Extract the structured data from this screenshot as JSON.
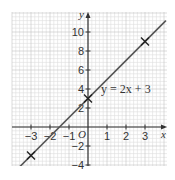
{
  "chart_data": {
    "type": "line",
    "title": "",
    "xlabel": "x",
    "ylabel": "y",
    "origin_label": "O",
    "xlim": [
      -4,
      4.2
    ],
    "ylim": [
      -4,
      12
    ],
    "grid": true,
    "x_ticks": [
      -3,
      -2,
      -1,
      1,
      2,
      3
    ],
    "x_tick_labels": [
      "−3",
      "−2",
      "−1",
      "1",
      "2",
      "3"
    ],
    "y_ticks": [
      -4,
      -2,
      2,
      4,
      6,
      8,
      10
    ],
    "y_tick_labels": [
      "−4",
      "−2",
      "2",
      "4",
      "6",
      "8",
      "10"
    ],
    "series": [
      {
        "name": "y = 2x + 3",
        "equation": "y = 2x + 3",
        "slope": 2,
        "intercept": 3,
        "x": [
          -3.9,
          4.1
        ],
        "y": [
          -4.8,
          11.2
        ]
      }
    ],
    "marked_points": [
      {
        "x": -3,
        "y": -3
      },
      {
        "x": 0,
        "y": 3
      },
      {
        "x": 3,
        "y": 9
      }
    ],
    "annotations": [
      {
        "text": "y = 2x + 3",
        "x": 1.9,
        "y": 4
      }
    ],
    "colors": {
      "line": "#555555",
      "axis": "#333333",
      "grid_minor": "#dddddd",
      "grid_major": "#c4c4c4",
      "marker": "#222222"
    }
  }
}
